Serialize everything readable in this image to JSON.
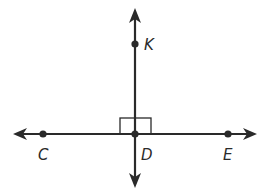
{
  "diagram": {
    "type": "perpendicular-lines",
    "colors": {
      "line": "#2a2a2a",
      "background": "#ffffff"
    },
    "horizontal_line": {
      "points": [
        {
          "label": "C",
          "x": 43,
          "y": 134
        },
        {
          "label": "D",
          "x": 135,
          "y": 134
        },
        {
          "label": "E",
          "x": 228,
          "y": 134
        }
      ],
      "arrows": "both"
    },
    "vertical_line": {
      "points": [
        {
          "label": "K",
          "x": 135,
          "y": 44
        },
        {
          "label": "D",
          "x": 135,
          "y": 134
        }
      ],
      "arrows": "both"
    },
    "right_angle_marker": {
      "at": "D"
    },
    "labels": {
      "K": "K",
      "C": "C",
      "D": "D",
      "E": "E"
    }
  }
}
